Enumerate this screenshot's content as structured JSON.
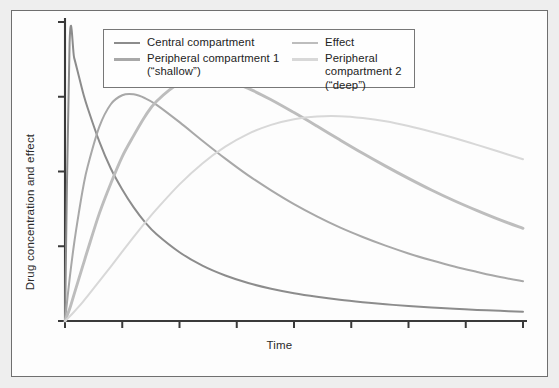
{
  "axes": {
    "ylabel": "Drug concentration and effect",
    "xlabel": "Time"
  },
  "legend": {
    "entries": [
      {
        "label": "Central compartment",
        "color": "#8c8c8c",
        "column": "left"
      },
      {
        "label": "Peripheral compartment 1\n(“shallow”)",
        "color": "#a8a8a8",
        "column": "left"
      },
      {
        "label": "Effect",
        "color": "#bdbdbd",
        "column": "right"
      },
      {
        "label": "Peripheral compartment 2\n(“deep”)",
        "color": "#d8d8d8",
        "column": "right"
      }
    ]
  },
  "colors": {
    "background": "#eeeeee",
    "panel": "#fdfdfd",
    "frame_border": "#6f6f6f",
    "axis": "#3a3a3a",
    "central": "#8c8c8c",
    "peripheral1": "#a8a8a8",
    "effect": "#bdbdbd",
    "peripheral2": "#d8d8d8"
  },
  "chart_data": {
    "type": "line",
    "title": "",
    "xlabel": "Time",
    "ylabel": "Drug concentration and effect",
    "xlim": [
      0,
      10
    ],
    "ylim": [
      0,
      1
    ],
    "grid": false,
    "legend_position": "top-center",
    "x_ticks": [
      0,
      1.25,
      2.5,
      3.75,
      5.0,
      6.25,
      7.5,
      8.75,
      10
    ],
    "x_tick_labels": [],
    "y_ticks": [
      0,
      0.25,
      0.5,
      0.75,
      1.0
    ],
    "y_tick_labels": [],
    "x": [
      0,
      0.1,
      0.2,
      0.3,
      0.4,
      0.5,
      0.75,
      1.0,
      1.25,
      1.5,
      1.75,
      2.0,
      2.5,
      3.0,
      3.5,
      4.0,
      4.5,
      5.0,
      5.5,
      6.0,
      6.5,
      7.0,
      7.5,
      8.0,
      8.5,
      9.0,
      9.5,
      10
    ],
    "series": [
      {
        "name": "Central compartment",
        "color": "#8c8c8c",
        "values": [
          0,
          0.93,
          0.88,
          0.82,
          0.76,
          0.71,
          0.6,
          0.51,
          0.44,
          0.38,
          0.33,
          0.29,
          0.23,
          0.185,
          0.152,
          0.127,
          0.108,
          0.093,
          0.081,
          0.071,
          0.063,
          0.056,
          0.05,
          0.045,
          0.041,
          0.037,
          0.034,
          0.031
        ]
      },
      {
        "name": "Peripheral compartment 1 (“shallow”)",
        "color": "#a8a8a8",
        "values": [
          0,
          0.14,
          0.26,
          0.36,
          0.45,
          0.52,
          0.65,
          0.725,
          0.755,
          0.758,
          0.745,
          0.723,
          0.665,
          0.603,
          0.543,
          0.487,
          0.437,
          0.391,
          0.35,
          0.313,
          0.281,
          0.252,
          0.226,
          0.203,
          0.182,
          0.164,
          0.147,
          0.133
        ]
      },
      {
        "name": "Effect",
        "color": "#bdbdbd",
        "values": [
          0,
          0.04,
          0.09,
          0.14,
          0.19,
          0.24,
          0.36,
          0.46,
          0.55,
          0.62,
          0.685,
          0.735,
          0.795,
          0.815,
          0.805,
          0.778,
          0.74,
          0.697,
          0.652,
          0.606,
          0.561,
          0.518,
          0.477,
          0.438,
          0.402,
          0.369,
          0.338,
          0.31
        ]
      },
      {
        "name": "Peripheral compartment 2 (“deep”)",
        "color": "#d8d8d8",
        "values": [
          0,
          0.015,
          0.031,
          0.048,
          0.066,
          0.085,
          0.133,
          0.182,
          0.232,
          0.281,
          0.329,
          0.374,
          0.457,
          0.527,
          0.583,
          0.626,
          0.656,
          0.675,
          0.684,
          0.685,
          0.679,
          0.668,
          0.652,
          0.633,
          0.612,
          0.589,
          0.565,
          0.541
        ]
      }
    ]
  }
}
